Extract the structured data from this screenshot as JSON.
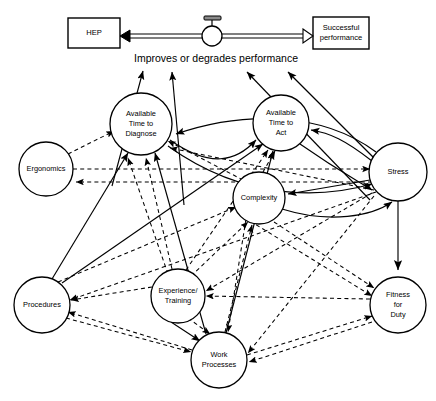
{
  "diagram": {
    "title_banner": "Improves or degrades performance",
    "boxes": [
      {
        "id": "hep",
        "label": "HEP",
        "x": 68,
        "y": 18,
        "w": 52,
        "h": 30
      },
      {
        "id": "successful-performance",
        "label_line1": "Successful",
        "label_line2": "performance",
        "x": 313,
        "y": 17,
        "w": 56,
        "h": 32
      }
    ],
    "valve": {
      "name": "flow-valve",
      "cx": 212,
      "cy": 36,
      "r": 10
    },
    "nodes": [
      {
        "id": "available-time-to-diagnose",
        "lines": [
          "Available",
          "Time to",
          "Diagnose"
        ],
        "cx": 141,
        "cy": 124,
        "r": 31
      },
      {
        "id": "available-time-to-act",
        "lines": [
          "Available",
          "Time to",
          "Act"
        ],
        "cx": 281,
        "cy": 123,
        "r": 28
      },
      {
        "id": "ergonomics",
        "lines": [
          "Ergonomics"
        ],
        "cx": 46,
        "cy": 169,
        "r": 27
      },
      {
        "id": "stress",
        "lines": [
          "Stress"
        ],
        "cx": 398,
        "cy": 172,
        "r": 29
      },
      {
        "id": "complexity",
        "lines": [
          "Complexity"
        ],
        "cx": 259,
        "cy": 198,
        "r": 26
      },
      {
        "id": "procedures",
        "lines": [
          "Procedures"
        ],
        "cx": 42,
        "cy": 305,
        "r": 28
      },
      {
        "id": "experience-training",
        "lines": [
          "Experience/",
          "Training"
        ],
        "cx": 178,
        "cy": 296,
        "r": 27
      },
      {
        "id": "work-processes",
        "lines": [
          "Work",
          "Processes"
        ],
        "cx": 219,
        "cy": 360,
        "r": 28
      },
      {
        "id": "fitness-for-duty",
        "lines": [
          "Fitness",
          "for",
          "Duty"
        ],
        "cx": 398,
        "cy": 305,
        "r": 28
      }
    ],
    "colors": {
      "stroke": "#000000",
      "fill": "#ffffff",
      "valve_handle": "#8a8a8a"
    }
  }
}
